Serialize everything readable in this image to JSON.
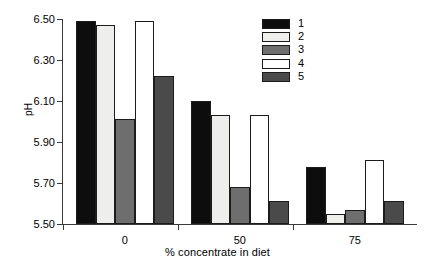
{
  "chart_data": {
    "type": "bar",
    "title": "",
    "subtitle": "",
    "xlabel": "% concentrate in diet",
    "ylabel": "pH",
    "categories": [
      "0",
      "50",
      "75"
    ],
    "ylim": [
      5.5,
      6.5
    ],
    "yticks": [
      "5.50",
      "5.70",
      "5.90",
      "6.10",
      "6.30",
      "6.50"
    ],
    "ytick_values": [
      5.5,
      5.7,
      5.9,
      6.1,
      6.3,
      6.5
    ],
    "grid": false,
    "legend_position": "top-right",
    "series": [
      {
        "name": "1",
        "color": "#0d0d0d",
        "values": [
          6.49,
          6.1,
          5.78
        ]
      },
      {
        "name": "2",
        "color": "#eeeeec",
        "values": [
          6.47,
          6.03,
          5.55
        ]
      },
      {
        "name": "3",
        "color": "#6e6e6e",
        "values": [
          6.01,
          5.68,
          5.57
        ]
      },
      {
        "name": "4",
        "color": "#ffffff",
        "values": [
          6.49,
          6.03,
          5.81
        ]
      },
      {
        "name": "5",
        "color": "#4a4a4a",
        "values": [
          6.22,
          5.61,
          5.61
        ]
      }
    ]
  },
  "legend": {
    "items": [
      {
        "label": "1",
        "color": "#0d0d0d"
      },
      {
        "label": "2",
        "color": "#eeeeec"
      },
      {
        "label": "3",
        "color": "#6e6e6e"
      },
      {
        "label": "4",
        "color": "#ffffff"
      },
      {
        "label": "5",
        "color": "#4a4a4a"
      }
    ]
  },
  "colors": {
    "axis": "#3a3a3a",
    "bar_outline": "#1c1c1c",
    "background": "#ffffff",
    "text": "#000000"
  }
}
